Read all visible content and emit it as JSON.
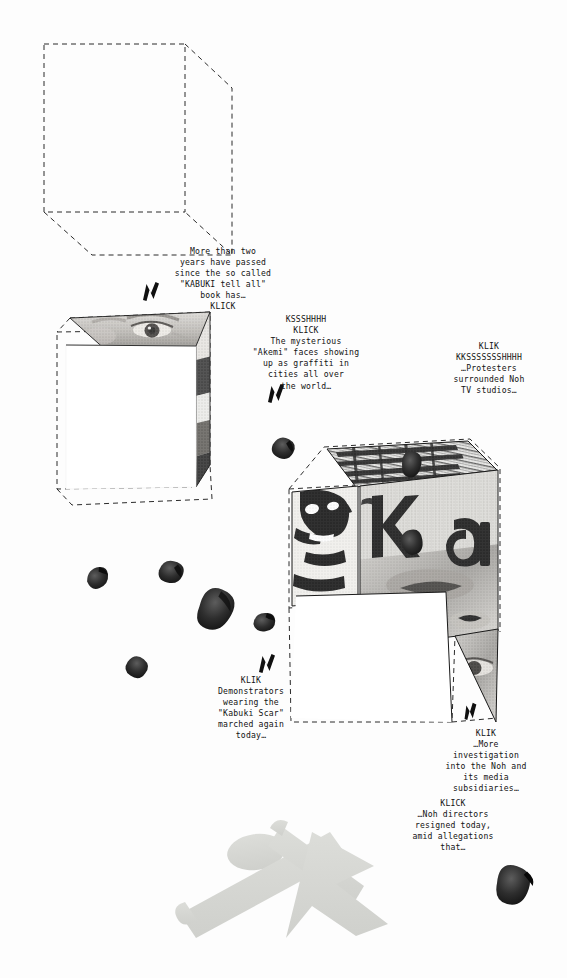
{
  "artwork": {
    "title": "Kabuki collage page",
    "background_color": "#fdfdfd",
    "ink_color": "#121212",
    "dash_color": "#2b2b2b",
    "figure_color": "#d9dad6"
  },
  "captions": [
    {
      "id": "caption-kabuki-book",
      "lines": [
        "More than two",
        "years have passed",
        "since the so called",
        "\"KABUKI tell all\"",
        "book has…",
        "KLICK"
      ],
      "sfx_first": "",
      "x": 158,
      "y": 246,
      "width": 130
    },
    {
      "id": "caption-akemi-graffiti",
      "lines": [
        "KSSSHHHH",
        "KLICK",
        "The mysterious",
        "\"Akemi\" faces showing",
        "up as graffiti in",
        "cities all over",
        "the world…"
      ],
      "sfx_first": "KSSSHHHH",
      "x": 241,
      "y": 314,
      "width": 130
    },
    {
      "id": "caption-protesters-noh",
      "lines": [
        "KLIK",
        "KKSSSSSSSHHHH",
        "…Protesters",
        "surrounded Noh",
        "TV studios…"
      ],
      "sfx_first": "KLIK",
      "x": 428,
      "y": 341,
      "width": 122
    },
    {
      "id": "caption-demonstrators",
      "lines": [
        "KLIK",
        "Demonstrators",
        "wearing the",
        "\"Kabuki Scar\"",
        "marched again",
        "today…"
      ],
      "sfx_first": "KLIK",
      "x": 196,
      "y": 675,
      "width": 110
    },
    {
      "id": "caption-investigation",
      "lines": [
        "KLIK",
        "…More",
        "investigation",
        "into the Noh and",
        "its media",
        "subsidiaries…"
      ],
      "sfx_first": "KLIK",
      "x": 425,
      "y": 728,
      "width": 122
    },
    {
      "id": "caption-noh-directors",
      "lines": [
        "KLICK",
        "…Noh directors",
        "resigned today,",
        "amid allegations",
        "that…"
      ],
      "sfx_first": "KLICK",
      "x": 390,
      "y": 798,
      "width": 126
    }
  ],
  "bolts": [
    {
      "id": "bolt-1",
      "x": 140,
      "y": 280,
      "size": 22
    },
    {
      "id": "bolt-2",
      "x": 265,
      "y": 382,
      "size": 22
    },
    {
      "id": "bolt-3",
      "x": 256,
      "y": 652,
      "size": 22
    },
    {
      "id": "bolt-4",
      "x": 460,
      "y": 700,
      "size": 20
    }
  ],
  "cubes": [
    {
      "id": "cube-outline-empty",
      "label": "empty dashed cube"
    },
    {
      "id": "cube-eye-panel",
      "label": "cube with eye photo panel"
    },
    {
      "id": "cube-graffiti-collage",
      "label": "cube with graffiti collage panels"
    }
  ],
  "collage_letters": [
    "K",
    "a"
  ],
  "figure": {
    "id": "running-figure-silhouette",
    "label": "pale running figure silhouette"
  },
  "petals": [
    {
      "id": "petal-1",
      "x": 84,
      "y": 572,
      "w": 22,
      "h": 20,
      "rot": -18,
      "tone": "#3c3c3c"
    },
    {
      "id": "petal-2",
      "x": 160,
      "y": 558,
      "w": 26,
      "h": 22,
      "rot": 14,
      "tone": "#4a4a4a"
    },
    {
      "id": "petal-3",
      "x": 208,
      "y": 582,
      "w": 38,
      "h": 44,
      "rot": 28,
      "tone": "#2a2a2a"
    },
    {
      "id": "petal-4",
      "x": 252,
      "y": 614,
      "w": 24,
      "h": 18,
      "rot": -8,
      "tone": "#3a3a3a"
    },
    {
      "id": "petal-5",
      "x": 133,
      "y": 652,
      "w": 20,
      "h": 22,
      "rot": 34,
      "tone": "#383838"
    },
    {
      "id": "petal-6",
      "x": 276,
      "y": 434,
      "w": 24,
      "h": 22,
      "rot": 22,
      "tone": "#343434"
    },
    {
      "id": "petal-7",
      "x": 402,
      "y": 450,
      "w": 20,
      "h": 28,
      "rot": 8,
      "tone": "#4a4a4a"
    },
    {
      "id": "petal-8",
      "x": 398,
      "y": 533,
      "w": 22,
      "h": 26,
      "rot": -14,
      "tone": "#3a3a3a"
    },
    {
      "id": "petal-9",
      "x": 501,
      "y": 861,
      "w": 40,
      "h": 42,
      "rot": 18,
      "tone": "#1c1c1c"
    }
  ]
}
